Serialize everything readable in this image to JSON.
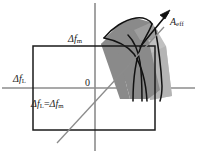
{
  "figure": {
    "type": "schematic-diagram",
    "background_color": "#ffffff",
    "axis_color": "#8c8c8c",
    "outline_color": "#111111",
    "shade_dark": "#878787",
    "shade_light": "#b9b9b9",
    "shade_mid": "#a3a3a3"
  },
  "axes": {
    "horizontal": {
      "label_delta": "Δ",
      "label_var": "f",
      "label_sub": "L",
      "y": 88
    },
    "vertical": {
      "label_delta": "Δ",
      "label_var": "f",
      "label_sub": "m",
      "x": 95
    },
    "origin": {
      "label": "0",
      "x": 95,
      "y": 88
    }
  },
  "rectangle": {
    "name": "tuning-range-box",
    "left": 33,
    "top": 46,
    "right": 155,
    "bottom": 130
  },
  "diagonal": {
    "label_parts": {
      "delta1": "Δ",
      "var1": "f",
      "sub1": "L",
      "equals": "=",
      "delta2": "Δ",
      "var2": "f",
      "sub2": "m"
    },
    "from": [
      58,
      142
    ],
    "to": [
      163,
      28
    ]
  },
  "arrow": {
    "label_var": "A",
    "label_sub": "eff",
    "tail": [
      150,
      37
    ],
    "tip": [
      170,
      12
    ]
  },
  "labels": {
    "delta_f_L": "Δf L",
    "delta_f_m": "Δf m",
    "origin": "0",
    "diagonal": "Δf L = Δf m",
    "a_eff": "A eff"
  }
}
